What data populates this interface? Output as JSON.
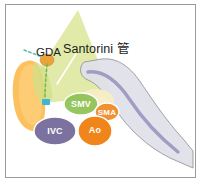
{
  "figure": {
    "border_color": "#9a9a9a",
    "background": "#ffffff"
  },
  "annotations": {
    "santorini_duct": "Santorini 管",
    "gda": "GDA"
  },
  "vessels": [
    {
      "id": "smv",
      "label": "SMV",
      "color": "#8cc152",
      "text_color": "#ffffff"
    },
    {
      "id": "sma",
      "label": "SMA",
      "color": "#ef8b28",
      "text_color": "#ffffff"
    },
    {
      "id": "ivc",
      "label": "IVC",
      "color": "#7b729f",
      "text_color": "#ffffff"
    },
    {
      "id": "ao",
      "label": "Ao",
      "color": "#f0861b",
      "text_color": "#ffffff"
    }
  ],
  "structures": [
    {
      "id": "duodenum",
      "name": "duodenum",
      "color": "#fbbe55"
    },
    {
      "id": "pancreas-head",
      "name": "pancreas-head-wedge",
      "color": "#d7e08a"
    },
    {
      "id": "pancreas-body-tail",
      "name": "pancreas-body-tail",
      "color": "#dcdce8"
    },
    {
      "id": "main-duct",
      "name": "main-pancreatic-duct",
      "color": "#9a96bf"
    },
    {
      "id": "gda-vessel",
      "name": "gastroduodenal-artery",
      "color": "#e8a33d"
    },
    {
      "id": "santorini-duct-line",
      "name": "santorini-duct-dotted",
      "color": "#7ab648"
    },
    {
      "id": "blue-marker",
      "name": "papilla-marker",
      "color": "#3fb5d8"
    },
    {
      "id": "cream-mass",
      "name": "uncinate-process",
      "color": "#f5edc2"
    }
  ]
}
